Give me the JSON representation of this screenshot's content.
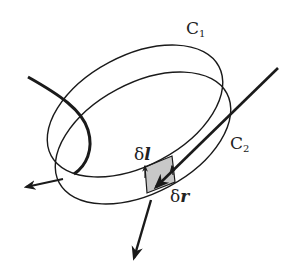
{
  "diagram": {
    "labels": {
      "c1_main": "C",
      "c1_sub": "1",
      "c2_main": "C",
      "c2_sub": "2",
      "dl_delta": "δ",
      "dl_var": "l",
      "dr_delta": "δ",
      "dr_var": "r"
    },
    "colors": {
      "stroke": "#1a1a1a",
      "shade": "#c8c8c8",
      "background": "#ffffff"
    }
  }
}
